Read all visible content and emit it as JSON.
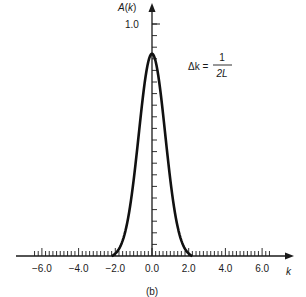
{
  "chart_data": {
    "type": "line",
    "title": "",
    "caption": "(b)",
    "xlabel": "k",
    "ylabel": "A(k)",
    "xlim": [
      -7.0,
      7.0
    ],
    "ylim": [
      0,
      1.05
    ],
    "xticks": [
      "-6.0",
      "-4.0",
      "-2.0",
      "0.0",
      "2.0",
      "4.0",
      "6.0"
    ],
    "yticks": [
      "1.0"
    ],
    "grid": false,
    "legend": null,
    "annotation": {
      "lhs": "Δk =",
      "numerator": "1",
      "denominator": "2L"
    },
    "series": [
      {
        "name": "A(k)",
        "x": [
          -2.2,
          -2.0,
          -1.6,
          -1.2,
          -0.8,
          -0.4,
          0.0,
          0.4,
          0.8,
          1.2,
          1.6,
          2.0,
          2.2
        ],
        "values": [
          0.0,
          0.01,
          0.08,
          0.24,
          0.5,
          0.76,
          0.88,
          0.76,
          0.5,
          0.24,
          0.08,
          0.01,
          0.0
        ]
      }
    ]
  }
}
